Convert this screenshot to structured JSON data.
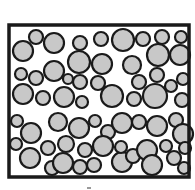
{
  "diagram": {
    "frame": {
      "x": 9,
      "y": 25,
      "width": 180,
      "height": 152,
      "stroke": "#1a1a1a",
      "stroke_width": 3.5
    },
    "particle_fill": "#c8c8c8",
    "particle_stroke": "#1a1a1a",
    "particles": [
      [
        23,
        51,
        10
      ],
      [
        36,
        37,
        7
      ],
      [
        54,
        43,
        10
      ],
      [
        80,
        43,
        7
      ],
      [
        101,
        39,
        7
      ],
      [
        123,
        40,
        11
      ],
      [
        143,
        39,
        7
      ],
      [
        162,
        37,
        7
      ],
      [
        181,
        37,
        6
      ],
      [
        158,
        55,
        11
      ],
      [
        180,
        55,
        10
      ],
      [
        79,
        62,
        11
      ],
      [
        102,
        64,
        10
      ],
      [
        132,
        65,
        9
      ],
      [
        21,
        74,
        6
      ],
      [
        36,
        78,
        7
      ],
      [
        54,
        71,
        10
      ],
      [
        68,
        79,
        5
      ],
      [
        80,
        82,
        7
      ],
      [
        98,
        83,
        7
      ],
      [
        139,
        82,
        7
      ],
      [
        157,
        75,
        7
      ],
      [
        171,
        86,
        6
      ],
      [
        183,
        79,
        6
      ],
      [
        23,
        94,
        10
      ],
      [
        43,
        98,
        7
      ],
      [
        64,
        97,
        10
      ],
      [
        82,
        102,
        6
      ],
      [
        112,
        96,
        11
      ],
      [
        134,
        99,
        7
      ],
      [
        155,
        96,
        12
      ],
      [
        182,
        100,
        7
      ],
      [
        17,
        121,
        6
      ],
      [
        31,
        133,
        10
      ],
      [
        58,
        122,
        9
      ],
      [
        79,
        128,
        10
      ],
      [
        95,
        121,
        6
      ],
      [
        108,
        132,
        7
      ],
      [
        122,
        123,
        10
      ],
      [
        139,
        122,
        7
      ],
      [
        157,
        126,
        10
      ],
      [
        176,
        120,
        7
      ],
      [
        183,
        134,
        10
      ],
      [
        16,
        144,
        6
      ],
      [
        30,
        158,
        10
      ],
      [
        48,
        148,
        7
      ],
      [
        52,
        168,
        7
      ],
      [
        66,
        144,
        8
      ],
      [
        63,
        163,
        10
      ],
      [
        85,
        150,
        7
      ],
      [
        80,
        167,
        7
      ],
      [
        103,
        146,
        10
      ],
      [
        94,
        165,
        7
      ],
      [
        122,
        162,
        10
      ],
      [
        121,
        147,
        6
      ],
      [
        133,
        156,
        7
      ],
      [
        147,
        150,
        10
      ],
      [
        152,
        165,
        10
      ],
      [
        166,
        146,
        6
      ],
      [
        174,
        158,
        7
      ],
      [
        185,
        148,
        6
      ],
      [
        184,
        168,
        6
      ]
    ],
    "mark_below": {
      "x": 87,
      "y": 187,
      "w": 4,
      "h": 2
    }
  }
}
